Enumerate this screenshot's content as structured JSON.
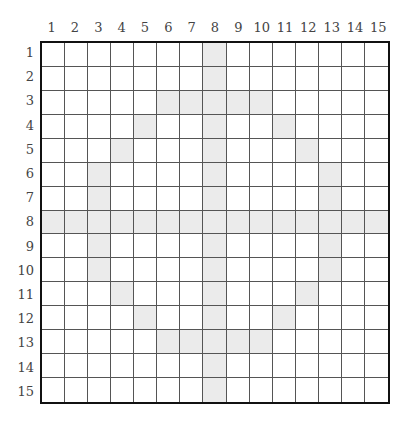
{
  "grid": {
    "rows": 15,
    "cols": 15,
    "col_labels": [
      "1",
      "2",
      "3",
      "4",
      "5",
      "6",
      "7",
      "8",
      "9",
      "10",
      "11",
      "12",
      "13",
      "14",
      "15"
    ],
    "row_labels": [
      "1",
      "2",
      "3",
      "4",
      "5",
      "6",
      "7",
      "8",
      "9",
      "10",
      "11",
      "12",
      "13",
      "14",
      "15"
    ],
    "shaded_color": "#ebebeb",
    "shaded_cells": [
      [
        1,
        8
      ],
      [
        2,
        8
      ],
      [
        3,
        6
      ],
      [
        3,
        7
      ],
      [
        3,
        8
      ],
      [
        3,
        9
      ],
      [
        3,
        10
      ],
      [
        4,
        5
      ],
      [
        4,
        8
      ],
      [
        4,
        11
      ],
      [
        5,
        4
      ],
      [
        5,
        8
      ],
      [
        5,
        12
      ],
      [
        6,
        3
      ],
      [
        6,
        8
      ],
      [
        6,
        13
      ],
      [
        7,
        3
      ],
      [
        7,
        8
      ],
      [
        7,
        13
      ],
      [
        8,
        1
      ],
      [
        8,
        2
      ],
      [
        8,
        3
      ],
      [
        8,
        4
      ],
      [
        8,
        5
      ],
      [
        8,
        6
      ],
      [
        8,
        7
      ],
      [
        8,
        8
      ],
      [
        8,
        9
      ],
      [
        8,
        10
      ],
      [
        8,
        11
      ],
      [
        8,
        12
      ],
      [
        8,
        13
      ],
      [
        8,
        14
      ],
      [
        8,
        15
      ],
      [
        9,
        3
      ],
      [
        9,
        8
      ],
      [
        9,
        13
      ],
      [
        10,
        3
      ],
      [
        10,
        8
      ],
      [
        10,
        13
      ],
      [
        11,
        4
      ],
      [
        11,
        8
      ],
      [
        11,
        12
      ],
      [
        12,
        5
      ],
      [
        12,
        8
      ],
      [
        12,
        11
      ],
      [
        13,
        6
      ],
      [
        13,
        7
      ],
      [
        13,
        8
      ],
      [
        13,
        9
      ],
      [
        13,
        10
      ],
      [
        14,
        8
      ],
      [
        15,
        8
      ]
    ]
  }
}
